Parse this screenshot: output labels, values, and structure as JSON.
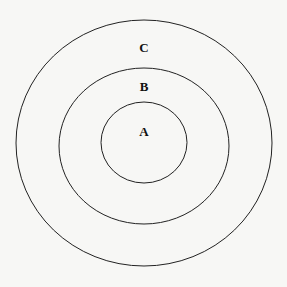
{
  "diagram": {
    "type": "concentric-circles",
    "rings": [
      {
        "label": "A",
        "cx": 144,
        "cy": 142.5,
        "rx": 43,
        "ry": 40.5
      },
      {
        "label": "B",
        "cx": 144,
        "cy": 146,
        "rx": 85,
        "ry": 78
      },
      {
        "label": "C",
        "cx": 144,
        "cy": 143,
        "rx": 128,
        "ry": 123
      }
    ],
    "labels": {
      "a": "A",
      "b": "B",
      "c": "C"
    },
    "stroke_color": "#222222",
    "background_color": "#f7f7f5"
  }
}
